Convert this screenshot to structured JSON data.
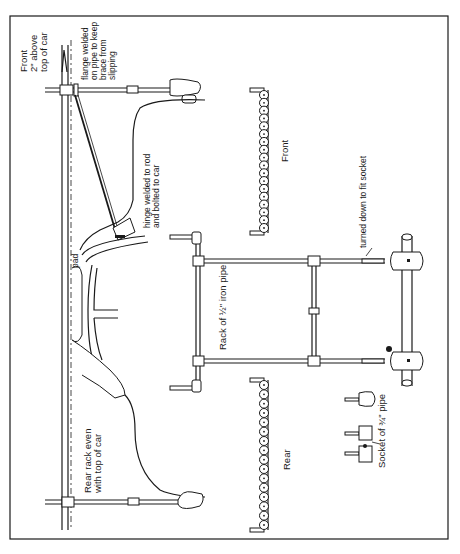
{
  "diagram": {
    "labels": {
      "front_height": [
        "Front",
        "2\" above",
        "top of car"
      ],
      "flange": [
        "flange welded",
        "on pipe to keep",
        "brace from",
        "slipping"
      ],
      "hinge": [
        "hinge welded to rod",
        "and bolted to car"
      ],
      "pad": "pad",
      "rear_rack": [
        "Rear rack even",
        "with top of car"
      ],
      "front_view": "Front",
      "rear_view": "Rear",
      "turned_down": "turned down to fit socket",
      "rack_material": "Rack of ½\" iron pipe",
      "socket": "Socket of ¾\" pipe"
    },
    "colors": {
      "ink": "#1a1a1a",
      "paper": "#ffffff"
    }
  }
}
